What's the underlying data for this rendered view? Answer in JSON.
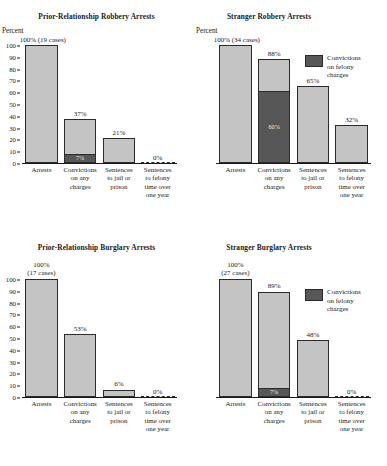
{
  "figure": {
    "bar_fill": "#c4c4c4",
    "bar_stroke": "#2b2b2b",
    "felony_fill": "#575757",
    "background": "#ffffff"
  },
  "legend": {
    "label": "Convictions\non felony\ncharges",
    "swatch_color": "#575757"
  },
  "axis": {
    "percent_label": "Percent",
    "ticks": [
      "100",
      "90",
      "80",
      "70",
      "60",
      "50",
      "40",
      "30",
      "20",
      "10",
      "0"
    ],
    "categories": [
      "Arrests",
      "Convictions\non any\ncharges",
      "Sentences\nto jail or\nprison",
      "Sentences\nto felony\ntime over\none year"
    ]
  },
  "chart_data": [
    {
      "type": "bar",
      "id": "prior-relationship-robbery",
      "title": "Prior-Relationship Robbery Arrests",
      "ylabel": "Percent",
      "xlabel": "",
      "ylim": [
        0,
        100
      ],
      "grid": false,
      "y_axis_ticks": [
        "100",
        "90",
        "80",
        "70",
        "60",
        "50",
        "40",
        "30",
        "20",
        "10",
        "0"
      ],
      "show_y_axis": true,
      "legend_position": "none",
      "categories": [
        "Arrests",
        "Convictions\non any\ncharges",
        "Sentences\nto jail or\nprison",
        "Sentences\nto felony\ntime over\none year"
      ],
      "values": [
        100,
        37,
        21,
        0
      ],
      "data_labels": [
        "100% (19 cases)",
        "37%",
        "21%",
        "0%"
      ],
      "felony_values": [
        null,
        7,
        null,
        null
      ],
      "felony_labels": [
        null,
        "7%",
        null,
        null
      ],
      "n_cases": 19
    },
    {
      "type": "bar",
      "id": "stranger-robbery",
      "title": "Stranger Robbery Arrests",
      "ylabel": "Percent",
      "xlabel": "",
      "ylim": [
        0,
        100
      ],
      "grid": false,
      "y_axis_ticks": [],
      "show_y_axis": false,
      "legend_position": "upper right",
      "categories": [
        "Arrests",
        "Convictions\non any\ncharges",
        "Sentences\nto jail or\nprison",
        "Sentences\nto felony\ntime over\none year"
      ],
      "values": [
        100,
        88,
        65,
        32
      ],
      "data_labels": [
        "100% (34 cases)",
        "88%",
        "65%",
        "32%"
      ],
      "felony_values": [
        null,
        60,
        null,
        null
      ],
      "felony_labels": [
        null,
        "60%",
        null,
        null
      ],
      "n_cases": 34
    },
    {
      "type": "bar",
      "id": "prior-relationship-burglary",
      "title": "Prior-Relationship Burglary Arrests",
      "ylabel": "",
      "xlabel": "",
      "ylim": [
        0,
        100
      ],
      "grid": false,
      "y_axis_ticks": [
        "100",
        "90",
        "80",
        "70",
        "60",
        "50",
        "40",
        "30",
        "20",
        "10",
        "0"
      ],
      "show_y_axis": true,
      "legend_position": "none",
      "categories": [
        "Arrests",
        "Convictions\non any\ncharges",
        "Sentences\nto jail or\nprison",
        "Sentences\nto felony\ntime over\none year"
      ],
      "values": [
        100,
        53,
        6,
        0
      ],
      "data_labels": [
        "100%\n(17 cases)",
        "53%",
        "6%",
        "0%"
      ],
      "felony_values": [
        null,
        null,
        null,
        null
      ],
      "felony_labels": [
        null,
        null,
        null,
        null
      ],
      "n_cases": 17
    },
    {
      "type": "bar",
      "id": "stranger-burglary",
      "title": "Stranger Burglary Arrests",
      "ylabel": "",
      "xlabel": "",
      "ylim": [
        0,
        100
      ],
      "grid": false,
      "y_axis_ticks": [],
      "show_y_axis": false,
      "legend_position": "upper right",
      "categories": [
        "Arrests",
        "Convictions\non any\ncharges",
        "Sentences\nto jail or\nprison",
        "Sentences\nto felony\ntime over\none year"
      ],
      "values": [
        100,
        89,
        48,
        0
      ],
      "data_labels": [
        "100%\n(27 cases)",
        "89%",
        "48%",
        "0%"
      ],
      "felony_values": [
        null,
        7,
        null,
        null
      ],
      "felony_labels": [
        null,
        "7%",
        null,
        null
      ],
      "n_cases": 27
    }
  ]
}
